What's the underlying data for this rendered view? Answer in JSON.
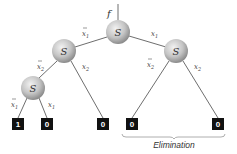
{
  "diagram": {
    "function_label": "f",
    "node_label": "S",
    "nodes": [
      {
        "id": "root",
        "label": "S"
      },
      {
        "id": "left",
        "label": "S"
      },
      {
        "id": "right",
        "label": "S"
      },
      {
        "id": "left-left",
        "label": "S"
      }
    ],
    "edge_labels": {
      "root_left": "x1",
      "root_right": "x1",
      "left_left": "x2",
      "left_right": "x2",
      "right_left": "x2",
      "right_right": "x2",
      "ll_left": "x1",
      "ll_right": "x1"
    },
    "edge_sub": {
      "x1": "1",
      "x2": "2"
    },
    "leaves": [
      "1",
      "0",
      "0",
      "0",
      "0"
    ],
    "bracket_label": "Elimination"
  }
}
